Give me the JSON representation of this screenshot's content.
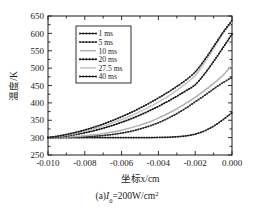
{
  "chart_data": {
    "type": "line",
    "title": "",
    "caption": "(a)I₀=200W/cm²",
    "caption_parts": {
      "prefix": "(a)",
      "symbol": "I",
      "subscript": "0",
      "equals": "=200W/cm",
      "superscript": "2"
    },
    "xlabel": "坐标x/cm",
    "ylabel": "温度/K",
    "xlim": [
      -0.01,
      0.0
    ],
    "ylim": [
      250,
      650
    ],
    "xticks": [
      -0.01,
      -0.008,
      -0.006,
      -0.004,
      -0.002,
      0.0
    ],
    "xticklabels": [
      "-0.010",
      "-0.008",
      "-0.006",
      "-0.004",
      "-0.002",
      "0.000"
    ],
    "yticks": [
      250,
      300,
      350,
      400,
      450,
      500,
      550,
      600,
      650
    ],
    "yticklabels": [
      "250",
      "300",
      "350",
      "400",
      "450",
      "500",
      "550",
      "600",
      "650"
    ],
    "grid": false,
    "legend_position": "upper left",
    "x": [
      -0.01,
      -0.0095,
      -0.009,
      -0.0085,
      -0.008,
      -0.0075,
      -0.007,
      -0.0065,
      -0.006,
      -0.0055,
      -0.005,
      -0.0045,
      -0.004,
      -0.0035,
      -0.003,
      -0.0025,
      -0.002,
      -0.0015,
      -0.001,
      -0.0005,
      0.0
    ],
    "series": [
      {
        "name": "1 ms",
        "label": "1 ms",
        "color": "#1a1a1a",
        "style": "marker-line",
        "values": [
          300,
          300,
          300,
          300,
          300,
          300,
          300,
          300,
          300,
          300,
          300,
          300,
          300.5,
          301,
          302.5,
          305,
          310,
          319,
          333,
          351,
          372
        ]
      },
      {
        "name": "5 ms",
        "label": "5 ms",
        "color": "#2b2b2b",
        "style": "marker-line",
        "values": [
          300,
          300.5,
          301,
          301.5,
          302.5,
          304,
          306,
          309,
          313,
          318,
          325,
          333,
          343,
          355,
          369,
          385,
          403,
          421,
          440,
          458,
          473
        ]
      },
      {
        "name": "10 ms",
        "label": "10 ms",
        "color": "#b0b0b0",
        "style": "plain-line",
        "values": [
          300,
          301,
          302,
          303.5,
          305.5,
          308,
          311.5,
          316,
          321.5,
          328,
          336,
          345,
          356,
          369,
          383,
          399,
          416,
          435,
          456,
          479,
          508
        ]
      },
      {
        "name": "20 ms",
        "label": "20 ms",
        "color": "#111111",
        "style": "marker-line",
        "values": [
          300,
          302,
          305,
          309,
          314,
          320,
          327,
          335,
          344,
          354,
          365,
          377,
          390,
          404,
          419,
          435,
          452,
          483,
          519,
          558,
          598
        ]
      },
      {
        "name": "27.5 ms",
        "label": "27.5 ms",
        "color": "#c4c4c4",
        "style": "plain-line",
        "values": [
          300,
          303,
          307,
          312,
          318,
          325,
          333,
          342,
          352,
          363,
          375,
          388,
          402,
          418,
          436,
          456,
          479,
          515,
          556,
          598,
          633
        ]
      },
      {
        "name": "40 ms",
        "label": "40 ms",
        "color": "#1a1a1a",
        "style": "marker-line",
        "values": [
          300,
          304,
          309,
          315,
          322,
          330,
          339,
          349,
          360,
          372,
          385,
          399,
          414,
          430,
          447,
          466,
          489,
          523,
          562,
          602,
          637
        ]
      }
    ]
  }
}
